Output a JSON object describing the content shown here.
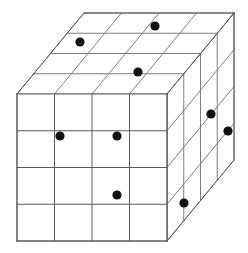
{
  "figure": {
    "type": "isometric-grid-cube",
    "canvas": {
      "width": 248,
      "height": 253,
      "background": "#ffffff"
    },
    "geometry": {
      "divisions": 4,
      "front_face": {
        "x": 17,
        "y": 94,
        "width": 150,
        "height": 147
      },
      "depth_offset": {
        "dx": 67,
        "dy": -81
      },
      "cell_width": 37.5,
      "cell_height": 36.75,
      "depth_step_x": 16.75,
      "depth_step_y": -20.25
    },
    "style": {
      "line_color": "#7d7d7d",
      "line_color_dark": "#5a5a5a",
      "line_width": 1,
      "dot_color": "#111111",
      "dot_radius": 4.6,
      "fill_color": "#ffffff"
    },
    "faces": [
      {
        "name": "top-face",
        "label": "Top face"
      },
      {
        "name": "front-face",
        "label": "Front face"
      },
      {
        "name": "right-face",
        "label": "Right side face"
      }
    ],
    "markers": [
      {
        "id": "marker-top-1",
        "face": "top-face",
        "cx": 80,
        "cy": 42
      },
      {
        "id": "marker-top-2",
        "face": "top-face",
        "cx": 155,
        "cy": 26
      },
      {
        "id": "marker-top-3",
        "face": "top-face",
        "cx": 138,
        "cy": 72
      },
      {
        "id": "marker-front-1",
        "face": "front-face",
        "cx": 60,
        "cy": 136
      },
      {
        "id": "marker-front-2",
        "face": "front-face",
        "cx": 117,
        "cy": 136
      },
      {
        "id": "marker-front-3",
        "face": "front-face",
        "cx": 117,
        "cy": 195
      },
      {
        "id": "marker-right-1",
        "face": "right-face",
        "cx": 211,
        "cy": 114
      },
      {
        "id": "marker-right-2",
        "face": "right-face",
        "cx": 228,
        "cy": 131
      },
      {
        "id": "marker-right-3",
        "face": "right-face",
        "cx": 184,
        "cy": 203
      }
    ]
  }
}
